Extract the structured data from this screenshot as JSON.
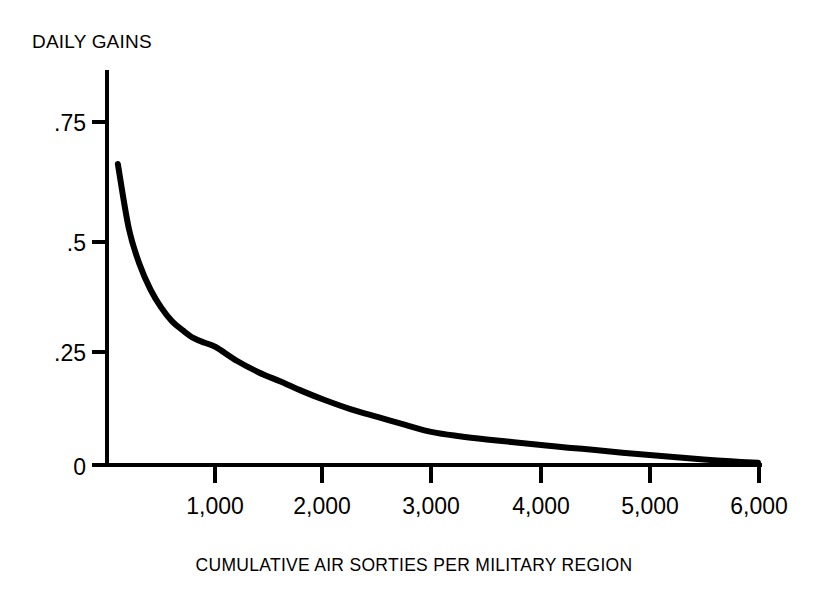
{
  "chart_data": {
    "type": "line",
    "title": "DAILY GAINS",
    "xlabel": "CUMULATIVE AIR SORTIES PER MILITARY REGION",
    "ylabel": "DAILY GAINS",
    "xlim": [
      0,
      6000
    ],
    "ylim": [
      0,
      0.8
    ],
    "grid": false,
    "legend": null,
    "x_tick_labels": [
      "1,000",
      "2,000",
      "3,000",
      "4,000",
      "5,000",
      "6,000"
    ],
    "x_tick_values": [
      1000,
      2000,
      3000,
      4000,
      5000,
      6000
    ],
    "y_tick_labels": [
      "0",
      ".25",
      ".5",
      ".75"
    ],
    "y_tick_values": [
      0,
      0.25,
      0.5,
      0.75
    ],
    "series": [
      {
        "name": "Daily gains",
        "color": "#000000",
        "x": [
          100,
          200,
          300,
          400,
          500,
          600,
          700,
          800,
          900,
          1000,
          1200,
          1400,
          1600,
          1800,
          2000,
          2250,
          2500,
          2750,
          3000,
          3250,
          3500,
          3750,
          4000,
          4250,
          4500,
          4750,
          5000,
          5250,
          5500,
          5750,
          6000
        ],
        "values": [
          0.66,
          0.52,
          0.44,
          0.385,
          0.345,
          0.315,
          0.295,
          0.278,
          0.268,
          0.259,
          0.228,
          0.203,
          0.183,
          0.162,
          0.143,
          0.122,
          0.105,
          0.088,
          0.072,
          0.063,
          0.056,
          0.05,
          0.044,
          0.038,
          0.033,
          0.027,
          0.022,
          0.017,
          0.012,
          0.008,
          0.005
        ]
      }
    ]
  },
  "axes": {
    "origin_px": {
      "x": 107,
      "y": 465
    },
    "x_px_per_unit": 0.1085,
    "y_px_per_unit": 456
  }
}
